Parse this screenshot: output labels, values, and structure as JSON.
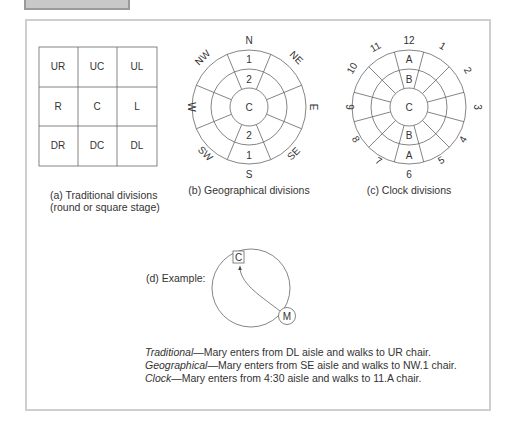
{
  "diagram": {
    "traditional": {
      "grid": [
        [
          "UR",
          "UC",
          "UL"
        ],
        [
          "R",
          "C",
          "L"
        ],
        [
          "DR",
          "DC",
          "DL"
        ]
      ],
      "caption_line1": "(a) Traditional divisions",
      "caption_line2": "(round or square stage)"
    },
    "geographical": {
      "directions": [
        "N",
        "NE",
        "E",
        "SE",
        "S",
        "SW",
        "W",
        "NW"
      ],
      "north_row1": "1",
      "north_row2": "2",
      "center": "C",
      "south_row2": "2",
      "south_row1": "1",
      "caption": "(b) Geographical divisions"
    },
    "clock": {
      "hours": [
        "12",
        "1",
        "2",
        "3",
        "4",
        "5",
        "6",
        "7",
        "8",
        "9",
        "10",
        "11"
      ],
      "top_outer": "A",
      "top_inner": "B",
      "center": "C",
      "bottom_inner": "B",
      "bottom_outer": "A",
      "caption": "(c) Clock divisions"
    },
    "example": {
      "label": "(d) Example:",
      "chair_label": "C",
      "actor_label": "M"
    },
    "descriptions": [
      {
        "term": "Traditional",
        "text": "—Mary enters from DL aisle and walks to UR chair."
      },
      {
        "term": "Geographical",
        "text": "—Mary enters from SE aisle and walks to NW.1 chair."
      },
      {
        "term": "Clock",
        "text": "—Mary enters from 4:30 aisle and walks to 11.A chair."
      }
    ],
    "colors": {
      "line": "#555555",
      "frame": "#cfcfcf",
      "tab": "#c8c8c8"
    }
  }
}
